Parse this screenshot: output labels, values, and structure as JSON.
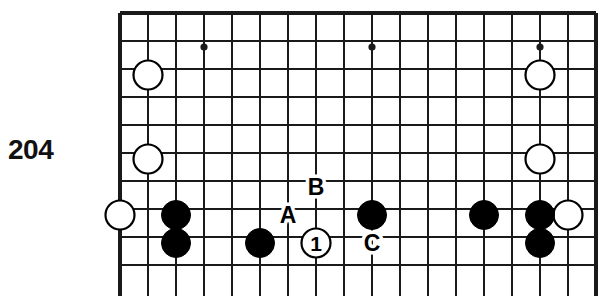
{
  "figure": {
    "number": "204",
    "type": "go-board-diagram",
    "colors": {
      "line": "#1a1a1a",
      "black_stone": "#000000",
      "white_stone_fill": "#ffffff",
      "white_stone_edge": "#000000",
      "background": "#ffffff",
      "text": "#111111"
    }
  },
  "board": {
    "left": 120,
    "top": 13,
    "spacing": 28,
    "cols": 18,
    "rows": 10,
    "edge_top": true,
    "edge_left": true,
    "edge_right": true,
    "edge_bottom": false,
    "star_points": [
      {
        "x": 204,
        "y": 47
      },
      {
        "x": 372,
        "y": 47
      },
      {
        "x": 540,
        "y": 47
      }
    ],
    "stone_radius": 14.5
  },
  "stones": [
    {
      "color": "white",
      "x": 148,
      "y": 75
    },
    {
      "color": "white",
      "x": 540,
      "y": 75
    },
    {
      "color": "white",
      "x": 148,
      "y": 159
    },
    {
      "color": "white",
      "x": 540,
      "y": 159
    },
    {
      "color": "white",
      "x": 120,
      "y": 215
    },
    {
      "color": "white",
      "x": 568,
      "y": 215
    },
    {
      "color": "black",
      "x": 176,
      "y": 215
    },
    {
      "color": "black",
      "x": 372,
      "y": 215
    },
    {
      "color": "black",
      "x": 484,
      "y": 215
    },
    {
      "color": "black",
      "x": 540,
      "y": 215
    },
    {
      "color": "black",
      "x": 176,
      "y": 243
    },
    {
      "color": "black",
      "x": 260,
      "y": 243
    },
    {
      "color": "black",
      "x": 540,
      "y": 243
    },
    {
      "color": "white",
      "x": 316,
      "y": 243,
      "number": "1"
    }
  ],
  "point_labels": [
    {
      "text": "A",
      "x": 288,
      "y": 215
    },
    {
      "text": "B",
      "x": 316,
      "y": 187
    },
    {
      "text": "C",
      "x": 372,
      "y": 243
    }
  ]
}
